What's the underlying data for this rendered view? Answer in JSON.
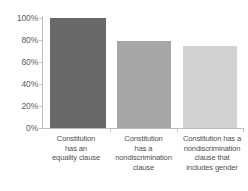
{
  "chart_data": {
    "type": "bar",
    "title": "",
    "subtitle": "",
    "xlabel": "",
    "ylabel": "",
    "categories": [
      "Constitution has an equality clause",
      "Constitution has a nondiscrimination clause",
      "Constitution has a nondiscrimination clause that includes gender"
    ],
    "category_lines": [
      [
        "Constitution",
        "has an",
        "equality clause"
      ],
      [
        "Constitution",
        "has a",
        "nondiscrimination",
        "clause"
      ],
      [
        "Constitution has a",
        "nondiscrimination",
        "clause that",
        "includes gender"
      ]
    ],
    "values": [
      100,
      79,
      75
    ],
    "value_labels": [
      "100%",
      "79%",
      "75%"
    ],
    "ylim": [
      0,
      100
    ],
    "yticks": [
      0,
      20,
      40,
      60,
      80,
      100
    ],
    "ytick_labels": [
      "0%",
      "20%",
      "40%",
      "60%",
      "80%",
      "100%"
    ],
    "grid": false,
    "legend": "none",
    "bar_colors": [
      "#696969",
      "#a6a6a6",
      "#d2d2d2"
    ],
    "axis_color": "#bdbdbd",
    "background": "#ffffff"
  }
}
